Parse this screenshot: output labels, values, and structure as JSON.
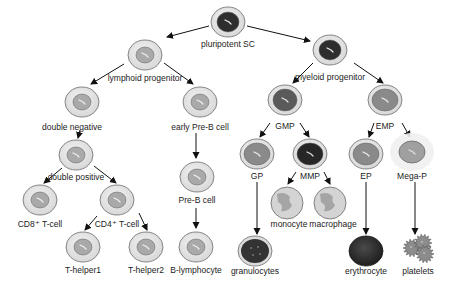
{
  "colors": {
    "cytoplasm": "#e2e2e2",
    "cytoplasm_stroke": "#6a6a6a",
    "nucleus_light": "#a9a9a9",
    "nucleus_mid": "#8a8a8a",
    "nucleus_dark": "#2e2e2e",
    "erythrocyte": "#2a2a2a",
    "arrow": "#111111"
  },
  "nodes": [
    {
      "id": "psc",
      "label": "pluripotent SC",
      "x": 228,
      "y": 22,
      "rx": 17,
      "ry": 15,
      "style": "stem-dark",
      "lx": 228,
      "ly": 47
    },
    {
      "id": "lymph",
      "label": "lymphoid progenitor",
      "x": 145,
      "y": 55,
      "rx": 17,
      "ry": 15,
      "style": "light",
      "lx": 145,
      "ly": 81
    },
    {
      "id": "myel",
      "label": "myeloid progenitor",
      "x": 330,
      "y": 50,
      "rx": 17,
      "ry": 15,
      "style": "stem-dark",
      "lx": 330,
      "ly": 80
    },
    {
      "id": "dn",
      "label": "double negative",
      "x": 82,
      "y": 102,
      "rx": 17,
      "ry": 15,
      "style": "light",
      "lx": 72,
      "ly": 130
    },
    {
      "id": "epb",
      "label": "early Pre-B cell",
      "x": 200,
      "y": 102,
      "rx": 17,
      "ry": 15,
      "style": "light",
      "lx": 200,
      "ly": 130
    },
    {
      "id": "gmp",
      "label": "GMP",
      "x": 285,
      "y": 100,
      "rx": 17,
      "ry": 15,
      "style": "mid-dark",
      "lx": 285,
      "ly": 129
    },
    {
      "id": "emp",
      "label": "EMP",
      "x": 385,
      "y": 100,
      "rx": 17,
      "ry": 15,
      "style": "mid",
      "lx": 385,
      "ly": 129
    },
    {
      "id": "dp",
      "label": "double positive",
      "x": 76,
      "y": 155,
      "rx": 17,
      "ry": 15,
      "style": "light",
      "lx": 76,
      "ly": 180
    },
    {
      "id": "preb",
      "label": "Pre-B cell",
      "x": 197,
      "y": 177,
      "rx": 17,
      "ry": 15,
      "style": "light",
      "lx": 197,
      "ly": 203
    },
    {
      "id": "gp",
      "label": "GP",
      "x": 257,
      "y": 154,
      "rx": 17,
      "ry": 15,
      "style": "mid",
      "lx": 257,
      "ly": 179
    },
    {
      "id": "mmp",
      "label": "MMP",
      "x": 310,
      "y": 154,
      "rx": 17,
      "ry": 15,
      "style": "dark",
      "lx": 310,
      "ly": 179
    },
    {
      "id": "ep",
      "label": "EP",
      "x": 366,
      "y": 154,
      "rx": 17,
      "ry": 15,
      "style": "mid",
      "lx": 366,
      "ly": 179
    },
    {
      "id": "megap",
      "label": "Mega-P",
      "x": 412,
      "y": 152,
      "rx": 13,
      "ry": 11,
      "style": "mega",
      "lx": 412,
      "ly": 179
    },
    {
      "id": "cd8",
      "label": "CD8⁺ T-cell",
      "x": 40,
      "y": 200,
      "rx": 17,
      "ry": 15,
      "style": "light",
      "lx": 40,
      "ly": 227
    },
    {
      "id": "cd4",
      "label": "CD4⁺ T-cell",
      "x": 117,
      "y": 200,
      "rx": 17,
      "ry": 15,
      "style": "light",
      "lx": 117,
      "ly": 227
    },
    {
      "id": "mono",
      "label": "monocyte",
      "x": 287,
      "y": 203,
      "rx": 16,
      "ry": 16,
      "style": "mono",
      "lx": 289,
      "ly": 227
    },
    {
      "id": "macro",
      "label": "macrophage",
      "x": 330,
      "y": 203,
      "rx": 16,
      "ry": 16,
      "style": "mono",
      "lx": 333,
      "ly": 227
    },
    {
      "id": "th1",
      "label": "T-helper1",
      "x": 83,
      "y": 247,
      "rx": 17,
      "ry": 15,
      "style": "light",
      "lx": 83,
      "ly": 273
    },
    {
      "id": "th2",
      "label": "T-helper2",
      "x": 146,
      "y": 247,
      "rx": 17,
      "ry": 15,
      "style": "light",
      "lx": 146,
      "ly": 273
    },
    {
      "id": "blym",
      "label": "B-lymphocyte",
      "x": 196,
      "y": 247,
      "rx": 17,
      "ry": 15,
      "style": "light",
      "lx": 196,
      "ly": 273
    },
    {
      "id": "gran",
      "label": "granulocytes",
      "x": 255,
      "y": 251,
      "rx": 17,
      "ry": 15,
      "style": "gran",
      "lx": 255,
      "ly": 274
    },
    {
      "id": "eryth",
      "label": "erythrocyte",
      "x": 366,
      "y": 251,
      "rx": 17,
      "ry": 15,
      "style": "eryth",
      "lx": 366,
      "ly": 274
    },
    {
      "id": "plt",
      "label": "platelets",
      "x": 418,
      "y": 250,
      "rx": 0,
      "ry": 0,
      "style": "platelets",
      "lx": 418,
      "ly": 274
    }
  ],
  "edges": [
    {
      "from": "psc",
      "to": "lymph",
      "x1": 209,
      "y1": 26,
      "x2": 167,
      "y2": 37
    },
    {
      "from": "psc",
      "to": "myel",
      "x1": 247,
      "y1": 26,
      "x2": 310,
      "y2": 41
    },
    {
      "from": "lymph",
      "to": "dn",
      "x1": 124,
      "y1": 64,
      "x2": 91,
      "y2": 84
    },
    {
      "from": "lymph",
      "to": "epb",
      "x1": 164,
      "y1": 63,
      "x2": 193,
      "y2": 84
    },
    {
      "from": "myel",
      "to": "gmp",
      "x1": 313,
      "y1": 63,
      "x2": 293,
      "y2": 83
    },
    {
      "from": "myel",
      "to": "emp",
      "x1": 354,
      "y1": 63,
      "x2": 383,
      "y2": 83
    },
    {
      "from": "dn",
      "to": "dp",
      "x1": 80,
      "y1": 130,
      "x2": 78,
      "y2": 138
    },
    {
      "from": "epb",
      "to": "preb",
      "x1": 196,
      "y1": 133,
      "x2": 196,
      "y2": 158
    },
    {
      "from": "gmp",
      "to": "gp",
      "x1": 270,
      "y1": 123,
      "x2": 260,
      "y2": 137
    },
    {
      "from": "gmp",
      "to": "mmp",
      "x1": 300,
      "y1": 123,
      "x2": 309,
      "y2": 137
    },
    {
      "from": "emp",
      "to": "ep",
      "x1": 374,
      "y1": 123,
      "x2": 369,
      "y2": 137
    },
    {
      "from": "emp",
      "to": "megap",
      "x1": 402,
      "y1": 123,
      "x2": 410,
      "y2": 137
    },
    {
      "from": "dp",
      "to": "cd8",
      "x1": 62,
      "y1": 168,
      "x2": 44,
      "y2": 183
    },
    {
      "from": "dp",
      "to": "cd4",
      "x1": 94,
      "y1": 166,
      "x2": 116,
      "y2": 183
    },
    {
      "from": "preb",
      "to": "blym",
      "x1": 196,
      "y1": 208,
      "x2": 196,
      "y2": 228
    },
    {
      "from": "mmp",
      "to": "mono",
      "x1": 296,
      "y1": 172,
      "x2": 288,
      "y2": 184
    },
    {
      "from": "mmp",
      "to": "macro",
      "x1": 324,
      "y1": 172,
      "x2": 330,
      "y2": 184
    },
    {
      "from": "cd4",
      "to": "th1",
      "x1": 97,
      "y1": 216,
      "x2": 85,
      "y2": 230
    },
    {
      "from": "cd4",
      "to": "th2",
      "x1": 139,
      "y1": 213,
      "x2": 147,
      "y2": 230
    },
    {
      "from": "gp",
      "to": "gran",
      "x1": 257,
      "y1": 182,
      "x2": 257,
      "y2": 234
    },
    {
      "from": "ep",
      "to": "eryth",
      "x1": 366,
      "y1": 182,
      "x2": 366,
      "y2": 234
    },
    {
      "from": "megap",
      "to": "plt",
      "x1": 415,
      "y1": 182,
      "x2": 415,
      "y2": 234
    }
  ]
}
